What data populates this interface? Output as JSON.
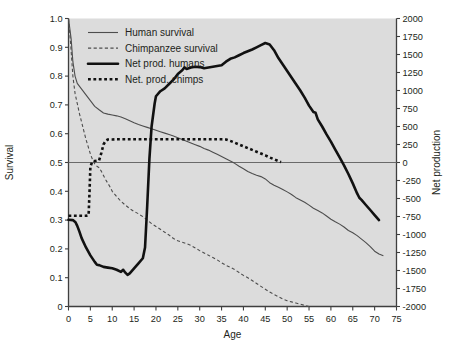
{
  "chart_data": {
    "type": "line",
    "title": "",
    "xlabel": "Age",
    "ylabel": "Survival",
    "y2label": "Net production",
    "xlim": [
      0,
      75
    ],
    "ylim": [
      0,
      1.0
    ],
    "y2lim": [
      -2000,
      2000
    ],
    "grid": false,
    "legend_position": "top-left",
    "xticks": [
      0,
      5,
      10,
      15,
      20,
      25,
      30,
      35,
      40,
      45,
      50,
      55,
      60,
      65,
      70,
      75
    ],
    "xtick_labels": [
      "0",
      "5",
      "10",
      "15",
      "20",
      "25",
      "30",
      "35",
      "40",
      "45",
      "50",
      "55",
      "60",
      "65",
      "70",
      "75"
    ],
    "yticks": [
      0,
      0.1,
      0.2,
      0.3,
      0.4,
      0.5,
      0.6,
      0.7,
      0.8,
      0.9,
      1.0
    ],
    "ytick_labels": [
      "0",
      "0.1",
      "0.2",
      "0.3",
      "0.4",
      "0.5",
      "0.6",
      "0.7",
      "0.8",
      "0.9",
      "1.0"
    ],
    "y2ticks": [
      -2000,
      -1750,
      -1500,
      -1250,
      -1000,
      -750,
      -500,
      -250,
      0,
      250,
      500,
      750,
      1000,
      1250,
      1500,
      1750,
      2000
    ],
    "y2tick_labels": [
      "-2000",
      "-1750",
      "-1500",
      "-1250",
      "-1000",
      "-750",
      "-500",
      "-250",
      "0",
      "250",
      "500",
      "750",
      "1000",
      "1250",
      "1500",
      "1750",
      "2000"
    ],
    "zero_line_value": 0,
    "series": [
      {
        "name": "Human survival",
        "axis": "left",
        "style": "solid-thin",
        "color": "#4d4d4d",
        "points": [
          [
            0,
            1.0
          ],
          [
            0.6,
            0.93
          ],
          [
            1,
            0.85
          ],
          [
            1.5,
            0.8
          ],
          [
            2,
            0.775
          ],
          [
            3,
            0.755
          ],
          [
            4,
            0.735
          ],
          [
            5,
            0.715
          ],
          [
            6,
            0.695
          ],
          [
            7,
            0.683
          ],
          [
            8,
            0.672
          ],
          [
            9,
            0.668
          ],
          [
            10,
            0.665
          ],
          [
            11,
            0.662
          ],
          [
            12,
            0.658
          ],
          [
            13,
            0.652
          ],
          [
            14,
            0.645
          ],
          [
            15,
            0.638
          ],
          [
            16,
            0.632
          ],
          [
            17,
            0.627
          ],
          [
            18,
            0.622
          ],
          [
            19,
            0.617
          ],
          [
            20,
            0.612
          ],
          [
            21,
            0.607
          ],
          [
            22,
            0.602
          ],
          [
            23,
            0.597
          ],
          [
            24,
            0.592
          ],
          [
            25,
            0.586
          ],
          [
            26,
            0.58
          ],
          [
            27,
            0.574
          ],
          [
            28,
            0.568
          ],
          [
            29,
            0.562
          ],
          [
            30,
            0.556
          ],
          [
            31,
            0.549
          ],
          [
            32,
            0.543
          ],
          [
            33,
            0.536
          ],
          [
            34,
            0.529
          ],
          [
            35,
            0.521
          ],
          [
            36,
            0.513
          ],
          [
            37,
            0.505
          ],
          [
            38,
            0.497
          ],
          [
            39,
            0.487
          ],
          [
            40,
            0.478
          ],
          [
            41,
            0.469
          ],
          [
            42,
            0.462
          ],
          [
            43,
            0.456
          ],
          [
            44,
            0.451
          ],
          [
            45,
            0.443
          ],
          [
            46,
            0.43
          ],
          [
            47,
            0.421
          ],
          [
            48,
            0.414
          ],
          [
            49,
            0.406
          ],
          [
            50,
            0.398
          ],
          [
            51,
            0.389
          ],
          [
            52,
            0.378
          ],
          [
            53,
            0.37
          ],
          [
            54,
            0.362
          ],
          [
            55,
            0.352
          ],
          [
            56,
            0.341
          ],
          [
            57,
            0.333
          ],
          [
            58,
            0.325
          ],
          [
            59,
            0.314
          ],
          [
            60,
            0.303
          ],
          [
            61,
            0.294
          ],
          [
            62,
            0.286
          ],
          [
            63,
            0.276
          ],
          [
            64,
            0.264
          ],
          [
            65,
            0.256
          ],
          [
            66,
            0.246
          ],
          [
            67,
            0.234
          ],
          [
            68,
            0.222
          ],
          [
            69,
            0.208
          ],
          [
            70,
            0.192
          ],
          [
            71,
            0.182
          ],
          [
            72,
            0.176
          ]
        ]
      },
      {
        "name": "Chimpanzee survival",
        "axis": "left",
        "style": "dashed-thin",
        "color": "#6b6b6b",
        "points": [
          [
            0,
            1.0
          ],
          [
            0.5,
            0.91
          ],
          [
            1,
            0.8
          ],
          [
            1.5,
            0.74
          ],
          [
            2,
            0.705
          ],
          [
            2.5,
            0.67
          ],
          [
            3,
            0.64
          ],
          [
            3.5,
            0.61
          ],
          [
            4,
            0.58
          ],
          [
            4.5,
            0.555
          ],
          [
            5,
            0.53
          ],
          [
            5.5,
            0.51
          ],
          [
            6,
            0.495
          ],
          [
            6.5,
            0.487
          ],
          [
            7,
            0.482
          ],
          [
            7.5,
            0.47
          ],
          [
            8,
            0.455
          ],
          [
            8.5,
            0.44
          ],
          [
            9,
            0.428
          ],
          [
            9.5,
            0.415
          ],
          [
            10,
            0.4
          ],
          [
            11,
            0.382
          ],
          [
            12,
            0.365
          ],
          [
            13,
            0.352
          ],
          [
            14,
            0.34
          ],
          [
            15,
            0.33
          ],
          [
            16,
            0.322
          ],
          [
            17,
            0.312
          ],
          [
            18,
            0.3
          ],
          [
            19,
            0.288
          ],
          [
            20,
            0.278
          ],
          [
            21,
            0.268
          ],
          [
            22,
            0.258
          ],
          [
            23,
            0.248
          ],
          [
            24,
            0.236
          ],
          [
            25,
            0.228
          ],
          [
            26,
            0.223
          ],
          [
            27,
            0.218
          ],
          [
            28,
            0.212
          ],
          [
            29,
            0.203
          ],
          [
            30,
            0.194
          ],
          [
            31,
            0.186
          ],
          [
            32,
            0.178
          ],
          [
            33,
            0.17
          ],
          [
            34,
            0.162
          ],
          [
            35,
            0.152
          ],
          [
            36,
            0.143
          ],
          [
            37,
            0.136
          ],
          [
            38,
            0.128
          ],
          [
            39,
            0.118
          ],
          [
            40,
            0.108
          ],
          [
            41,
            0.1
          ],
          [
            42,
            0.09
          ],
          [
            43,
            0.08
          ],
          [
            44,
            0.07
          ],
          [
            45,
            0.06
          ],
          [
            46,
            0.05
          ],
          [
            47,
            0.042
          ],
          [
            48,
            0.034
          ],
          [
            49,
            0.026
          ],
          [
            50,
            0.02
          ],
          [
            51,
            0.016
          ],
          [
            52,
            0.012
          ],
          [
            53,
            0.008
          ],
          [
            54,
            0.004
          ],
          [
            55,
            0.0
          ]
        ]
      },
      {
        "name": "Net prod. humans",
        "axis": "right",
        "style": "solid-thick",
        "color": "#111111",
        "points": [
          [
            0,
            -795
          ],
          [
            1,
            -800
          ],
          [
            1.6,
            -830
          ],
          [
            2,
            -880
          ],
          [
            2.5,
            -960
          ],
          [
            3,
            -1050
          ],
          [
            4,
            -1180
          ],
          [
            5,
            -1290
          ],
          [
            6,
            -1380
          ],
          [
            6.5,
            -1420
          ],
          [
            7,
            -1425
          ],
          [
            8,
            -1450
          ],
          [
            9,
            -1460
          ],
          [
            10,
            -1470
          ],
          [
            11,
            -1490
          ],
          [
            12,
            -1520
          ],
          [
            12.5,
            -1490
          ],
          [
            13,
            -1530
          ],
          [
            13.5,
            -1560
          ],
          [
            14,
            -1540
          ],
          [
            15,
            -1470
          ],
          [
            16,
            -1400
          ],
          [
            17,
            -1330
          ],
          [
            17.5,
            -1180
          ],
          [
            18,
            -600
          ],
          [
            18.5,
            50
          ],
          [
            19,
            500
          ],
          [
            19.7,
            820
          ],
          [
            20,
            920
          ],
          [
            21,
            990
          ],
          [
            22,
            1030
          ],
          [
            23,
            1090
          ],
          [
            24,
            1150
          ],
          [
            25,
            1230
          ],
          [
            26,
            1280
          ],
          [
            26.5,
            1320
          ],
          [
            27,
            1300
          ],
          [
            28,
            1320
          ],
          [
            29,
            1330
          ],
          [
            30,
            1325
          ],
          [
            31,
            1310
          ],
          [
            32,
            1320
          ],
          [
            33,
            1330
          ],
          [
            34,
            1340
          ],
          [
            35,
            1350
          ],
          [
            36,
            1400
          ],
          [
            37,
            1440
          ],
          [
            38,
            1460
          ],
          [
            39,
            1490
          ],
          [
            40,
            1520
          ],
          [
            41,
            1545
          ],
          [
            42,
            1570
          ],
          [
            43,
            1600
          ],
          [
            44,
            1630
          ],
          [
            45,
            1660
          ],
          [
            46,
            1640
          ],
          [
            47,
            1560
          ],
          [
            48,
            1450
          ],
          [
            49,
            1360
          ],
          [
            50,
            1270
          ],
          [
            51,
            1180
          ],
          [
            52,
            1090
          ],
          [
            53,
            1000
          ],
          [
            54,
            900
          ],
          [
            55,
            790
          ],
          [
            56,
            700
          ],
          [
            56.5,
            690
          ],
          [
            57,
            600
          ],
          [
            58,
            500
          ],
          [
            59,
            390
          ],
          [
            60,
            290
          ],
          [
            61,
            180
          ],
          [
            62,
            70
          ],
          [
            63,
            -40
          ],
          [
            64,
            -160
          ],
          [
            65,
            -290
          ],
          [
            66,
            -430
          ],
          [
            66.5,
            -490
          ],
          [
            67,
            -520
          ],
          [
            68,
            -590
          ],
          [
            69,
            -660
          ],
          [
            70,
            -730
          ],
          [
            71,
            -800
          ]
        ]
      },
      {
        "name": "Net. prod. chimps",
        "axis": "right",
        "style": "dotted-thick",
        "color": "#111111",
        "points": [
          [
            0,
            -740
          ],
          [
            1,
            -740
          ],
          [
            2,
            -740
          ],
          [
            3,
            -740
          ],
          [
            4,
            -740
          ],
          [
            4.6,
            -730
          ],
          [
            4.8,
            -420
          ],
          [
            5,
            -60
          ],
          [
            5.4,
            10
          ],
          [
            6,
            20
          ],
          [
            6.5,
            25
          ],
          [
            7,
            30
          ],
          [
            7.5,
            130
          ],
          [
            8,
            250
          ],
          [
            8.5,
            300
          ],
          [
            9,
            320
          ],
          [
            10,
            320
          ],
          [
            11,
            322
          ],
          [
            12,
            322
          ],
          [
            13,
            322
          ],
          [
            14,
            322
          ],
          [
            15,
            322
          ],
          [
            16,
            322
          ],
          [
            17,
            322
          ],
          [
            18,
            322
          ],
          [
            19,
            322
          ],
          [
            20,
            322
          ],
          [
            21,
            322
          ],
          [
            22,
            322
          ],
          [
            23,
            322
          ],
          [
            24,
            322
          ],
          [
            25,
            322
          ],
          [
            26,
            322
          ],
          [
            27,
            322
          ],
          [
            28,
            322
          ],
          [
            29,
            322
          ],
          [
            30,
            322
          ],
          [
            31,
            322
          ],
          [
            32,
            322
          ],
          [
            33,
            322
          ],
          [
            34,
            322
          ],
          [
            35,
            322
          ],
          [
            36,
            320
          ],
          [
            37,
            300
          ],
          [
            38,
            275
          ],
          [
            39,
            250
          ],
          [
            40,
            225
          ],
          [
            41,
            200
          ],
          [
            42,
            175
          ],
          [
            43,
            150
          ],
          [
            44,
            125
          ],
          [
            45,
            100
          ],
          [
            46,
            70
          ],
          [
            47,
            45
          ],
          [
            48,
            20
          ],
          [
            48.6,
            5
          ]
        ]
      }
    ]
  },
  "legend": {
    "items": [
      {
        "label": "Human survival",
        "style": "solid-thin"
      },
      {
        "label": "Chimpanzee survival",
        "style": "dashed-thin"
      },
      {
        "label": "Net prod. humans",
        "style": "solid-thick"
      },
      {
        "label": "Net. prod. chimps",
        "style": "dotted-thick"
      }
    ]
  },
  "colors": {
    "plot_background": "#dcdcdc",
    "page_background": "#ffffff",
    "axis": "#3f3f3f",
    "thin_line": "#4d4d4d",
    "thick_line": "#111111",
    "text": "#231f20"
  }
}
